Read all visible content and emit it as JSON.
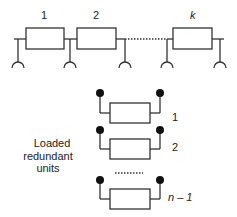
{
  "diagram": {
    "type": "standby-redundancy-schematic",
    "series_chain": {
      "unit_labels": [
        "1",
        "2",
        "k"
      ],
      "separator": "dotted"
    },
    "redundant_units": {
      "caption_lines": [
        "Loaded",
        "redundant",
        "units"
      ],
      "unit_labels": [
        "1",
        "2",
        "n – 1"
      ],
      "separator": "dotted"
    },
    "colors": {
      "stroke": "#333333",
      "terminal": "#111111",
      "background": "#ffffff"
    }
  }
}
